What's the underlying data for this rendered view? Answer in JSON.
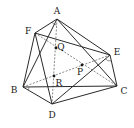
{
  "figure": {
    "vertices": [
      {
        "id": "A",
        "label": "A",
        "x": 57,
        "y": 19,
        "lx": 57,
        "ly": 11
      },
      {
        "id": "F",
        "label": "F",
        "x": 35,
        "y": 33,
        "lx": 28,
        "ly": 31
      },
      {
        "id": "E",
        "label": "E",
        "x": 110,
        "y": 55,
        "lx": 117,
        "ly": 52
      },
      {
        "id": "B",
        "label": "B",
        "x": 23,
        "y": 87,
        "lx": 14,
        "ly": 90
      },
      {
        "id": "C",
        "label": "C",
        "x": 117,
        "y": 86,
        "lx": 124,
        "ly": 91
      },
      {
        "id": "D",
        "label": "D",
        "x": 52,
        "y": 104,
        "lx": 52,
        "ly": 115
      }
    ],
    "points": [
      {
        "id": "Q",
        "label": "Q",
        "x": 56,
        "y": 48,
        "lx": 61,
        "ly": 47
      },
      {
        "id": "P",
        "label": "P",
        "x": 82,
        "y": 65,
        "lx": 80,
        "ly": 72
      },
      {
        "id": "R",
        "label": "R",
        "x": 54,
        "y": 76,
        "lx": 59,
        "ly": 83
      }
    ],
    "solid_edges": [
      [
        "A",
        "F"
      ],
      [
        "A",
        "B"
      ],
      [
        "A",
        "E"
      ],
      [
        "A",
        "C"
      ],
      [
        "F",
        "B"
      ],
      [
        "F",
        "D"
      ],
      [
        "F",
        "E"
      ],
      [
        "E",
        "C"
      ],
      [
        "E",
        "D"
      ],
      [
        "B",
        "D"
      ],
      [
        "B",
        "C"
      ],
      [
        "D",
        "C"
      ]
    ],
    "dashed_edges": [
      [
        "A",
        "D"
      ],
      [
        "F",
        "C"
      ],
      [
        "B",
        "E"
      ]
    ],
    "angle_marks": [
      "A",
      "B",
      "C",
      "E"
    ]
  }
}
